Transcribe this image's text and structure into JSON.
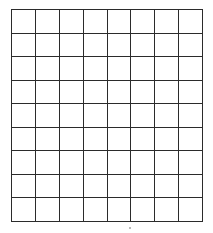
{
  "figure": {
    "type": "grid",
    "columns": 8,
    "rows": 9,
    "cell_width_px": 24,
    "cell_height_px": 23.7,
    "origin_x_px": 11,
    "origin_y_px": 9,
    "width_px": 192,
    "height_px": 213,
    "line_color": "#2b2b2b",
    "line_width_px": 1,
    "cell_fill": "#ffffff",
    "background": "#ffffff",
    "cell_labels": [
      [
        "",
        "",
        "",
        "",
        "",
        "",
        "",
        ""
      ],
      [
        "",
        "",
        "",
        "",
        "",
        "",
        "",
        ""
      ],
      [
        "",
        "",
        "",
        "",
        "",
        "",
        "",
        ""
      ],
      [
        "",
        "",
        "",
        "",
        "",
        "",
        "",
        ""
      ],
      [
        "",
        "",
        "",
        "",
        "",
        "",
        "",
        ""
      ],
      [
        "",
        "",
        "",
        "",
        "",
        "",
        "",
        ""
      ],
      [
        "",
        "",
        "",
        "",
        "",
        "",
        "",
        ""
      ],
      [
        "",
        "",
        "",
        "",
        "",
        "",
        "",
        ""
      ],
      [
        "",
        "",
        "",
        "",
        "",
        "",
        "",
        ""
      ]
    ]
  },
  "artifacts": [
    {
      "name": "scan-speck",
      "x_px": 129,
      "y_px": 227,
      "w_px": 2,
      "h_px": 2
    }
  ]
}
